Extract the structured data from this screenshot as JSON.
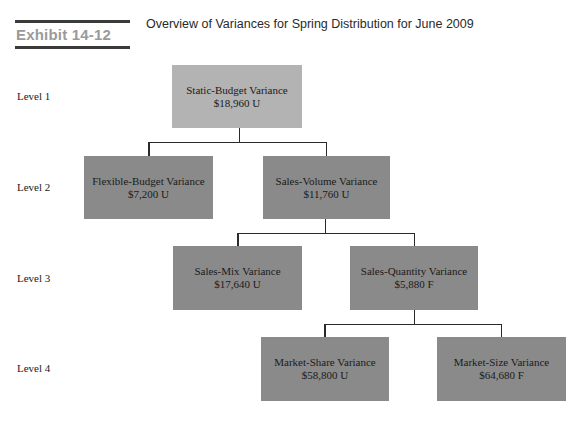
{
  "header": {
    "exhibit_label": "Exhibit 14-12",
    "title": "Overview of Variances for Spring Distribution for June 2009"
  },
  "levels": [
    {
      "label": "Level 1"
    },
    {
      "label": "Level 2"
    },
    {
      "label": "Level 3"
    },
    {
      "label": "Level 4"
    }
  ],
  "nodes": {
    "static_budget": {
      "name": "Static-Budget Variance",
      "value": "$18,960 U"
    },
    "flexible_budget": {
      "name": "Flexible-Budget Variance",
      "value": "$7,200 U"
    },
    "sales_volume": {
      "name": "Sales-Volume Variance",
      "value": "$11,760 U"
    },
    "sales_mix": {
      "name": "Sales-Mix Variance",
      "value": "$17,640 U"
    },
    "sales_quantity": {
      "name": "Sales-Quantity Variance",
      "value": "$5,880 F"
    },
    "market_share": {
      "name": "Market-Share Variance",
      "value": "$58,800 U"
    },
    "market_size": {
      "name": "Market-Size Variance",
      "value": "$64,680 F"
    }
  },
  "colors": {
    "root_fill": "#b3b3b3",
    "node_fill": "#8a8a8a",
    "connector": "#2a2a2a",
    "exhibit_label": "#9a9a9a"
  }
}
